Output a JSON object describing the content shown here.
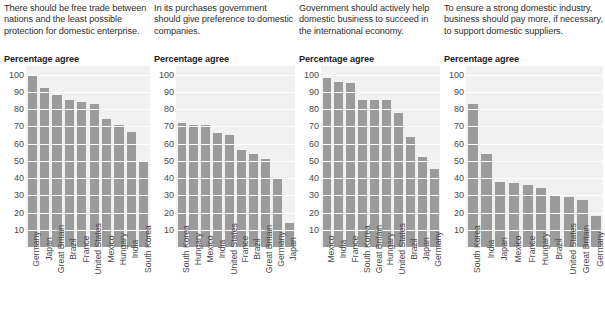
{
  "figure": {
    "background": "#ffffff",
    "bar_color": "#9b9b9b",
    "plot_background": "#f1f1f1",
    "gridline_color": "#ffffff",
    "text_color": "#3b3b3b"
  },
  "chart_data": [
    {
      "type": "bar",
      "title": "There should be free trade between nations and the least possible protection for domestic enterprise.",
      "ylabel": "Percentage agree",
      "xlabel": "",
      "ylim": [
        0,
        105
      ],
      "yticks": [
        100,
        90,
        80,
        70,
        60,
        50,
        40,
        30,
        20,
        10
      ],
      "grid": true,
      "legend": "none",
      "categories": [
        "Germany",
        "Japan",
        "Great Britain",
        "Brazil",
        "France",
        "United States",
        "Mexico",
        "Hungary",
        "India",
        "South Korea"
      ],
      "values": [
        100,
        92,
        88,
        85,
        84,
        83,
        74,
        71,
        67,
        50
      ]
    },
    {
      "type": "bar",
      "title": "In its purchases government should give preference to domestic companies.",
      "ylabel": "Percentage agree",
      "xlabel": "",
      "ylim": [
        0,
        105
      ],
      "yticks": [
        100,
        90,
        80,
        70,
        60,
        50,
        40,
        30,
        20,
        10
      ],
      "grid": true,
      "legend": "none",
      "categories": [
        "South Korea",
        "Hungary",
        "Mexico",
        "India",
        "United States",
        "France",
        "Brazil",
        "Great Britain",
        "Germany",
        "Japan"
      ],
      "values": [
        72,
        71,
        71,
        66,
        65,
        56,
        54,
        51,
        40,
        14
      ]
    },
    {
      "type": "bar",
      "title": "Government should actively help domestic business to succeed in the international economy.",
      "ylabel": "Percentage agree",
      "xlabel": "",
      "ylim": [
        0,
        105
      ],
      "yticks": [
        100,
        90,
        80,
        70,
        60,
        50,
        40,
        30,
        20,
        10
      ],
      "grid": true,
      "legend": "none",
      "categories": [
        "Mexico",
        "India",
        "France",
        "South Korea",
        "Great Britain",
        "Hungary",
        "United States",
        "Brazil",
        "Japan",
        "Germany"
      ],
      "values": [
        98,
        96,
        95,
        85,
        85,
        85,
        78,
        64,
        52,
        45
      ]
    },
    {
      "type": "bar",
      "title": "To ensure a strong domestic industry, business should pay more, if necessary, to support domestic suppliers.",
      "ylabel": "Percentage agree",
      "xlabel": "",
      "ylim": [
        0,
        105
      ],
      "yticks": [
        100,
        90,
        80,
        70,
        60,
        50,
        40,
        30,
        20,
        10
      ],
      "grid": true,
      "legend": "none",
      "categories": [
        "South Korea",
        "India",
        "Japan",
        "Mexico",
        "France",
        "Hungary",
        "Brazil",
        "United States",
        "Great Britain",
        "Germany"
      ],
      "values": [
        83,
        54,
        38,
        37,
        36,
        34,
        30,
        29,
        27,
        18
      ]
    }
  ]
}
